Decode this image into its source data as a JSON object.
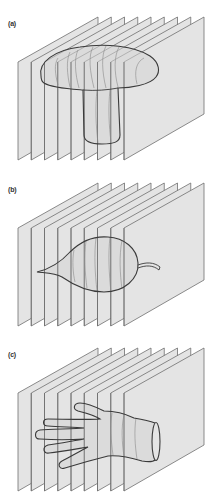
{
  "figure": {
    "panels": [
      {
        "label": "(a)",
        "object": "mushroom",
        "offset_y": 0
      },
      {
        "label": "(b)",
        "object": "leaf",
        "offset_y": 166
      },
      {
        "label": "(c)",
        "object": "hand",
        "offset_y": 331
      }
    ],
    "planes_per_panel": 9,
    "colors": {
      "plane_fill": "#e4e4e4",
      "plane_edge": "#6e6e6e",
      "object_outline": "#3a3a3a",
      "object_fill": "#d6d6d6",
      "contour": "#8a8a8a",
      "label": "#333333"
    }
  }
}
